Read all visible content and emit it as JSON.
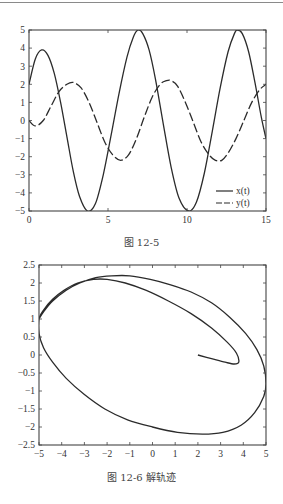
{
  "chart_data": [
    {
      "type": "line",
      "title": "",
      "caption": "图 12-5",
      "xlabel": "",
      "ylabel": "",
      "xlim": [
        0,
        15
      ],
      "ylim": [
        -5,
        5
      ],
      "xticks": [
        0,
        5,
        10,
        15
      ],
      "yticks": [
        5,
        4,
        3,
        2,
        1,
        0,
        -1,
        -2,
        -3,
        -4,
        -5
      ],
      "grid": false,
      "legend_position": "lower right",
      "series": [
        {
          "name": "x(t)",
          "style": "solid",
          "x": [
            0,
            0.4,
            0.8,
            1.2,
            1.6,
            2.0,
            2.4,
            2.8,
            3.2,
            3.7,
            4.2,
            4.7,
            5.2,
            5.7,
            6.2,
            6.6,
            6.9,
            7.2,
            7.6,
            8.0,
            8.5,
            9.0,
            9.5,
            10.1,
            10.6,
            11.1,
            11.6,
            12.1,
            12.6,
            13.0,
            13.2,
            13.5,
            13.9,
            14.3,
            14.7,
            15.0
          ],
          "y": [
            2.0,
            3.4,
            3.9,
            3.6,
            2.6,
            1.0,
            -0.9,
            -2.8,
            -4.2,
            -5.0,
            -4.6,
            -3.0,
            -0.8,
            1.5,
            3.5,
            4.6,
            5.0,
            4.8,
            3.9,
            2.3,
            -0.2,
            -2.6,
            -4.3,
            -5.0,
            -4.5,
            -2.9,
            -0.6,
            1.8,
            3.8,
            4.8,
            5.0,
            4.8,
            3.8,
            2.1,
            0.2,
            -1.0
          ]
        },
        {
          "name": "y(t)",
          "style": "dashed",
          "x": [
            0,
            0.4,
            0.9,
            1.4,
            1.9,
            2.4,
            2.8,
            3.3,
            3.8,
            4.3,
            4.8,
            5.3,
            5.8,
            6.3,
            6.8,
            7.3,
            7.8,
            8.3,
            8.7,
            9.0,
            9.4,
            9.9,
            10.4,
            10.9,
            11.4,
            11.8,
            12.2,
            12.6,
            13.1,
            13.6,
            14.1,
            14.6,
            15.0
          ],
          "y": [
            0.0,
            -0.3,
            0.0,
            0.8,
            1.6,
            2.0,
            2.1,
            1.8,
            1.0,
            -0.1,
            -1.2,
            -1.9,
            -2.2,
            -1.9,
            -1.0,
            0.2,
            1.3,
            2.0,
            2.2,
            2.2,
            1.9,
            1.0,
            -0.1,
            -1.2,
            -1.9,
            -2.2,
            -2.2,
            -1.8,
            -1.0,
            0.0,
            1.0,
            1.7,
            2.0
          ]
        }
      ]
    },
    {
      "type": "line",
      "title": "",
      "caption": "图 12-6   解轨迹",
      "xlabel": "",
      "ylabel": "",
      "xlim": [
        -5,
        5
      ],
      "ylim": [
        -2.5,
        2.5
      ],
      "xticks": [
        -5,
        -4,
        -3,
        -2,
        -1,
        0,
        1,
        2,
        3,
        4,
        5
      ],
      "yticks": [
        2.5,
        2,
        1.5,
        1,
        0.5,
        0,
        -0.5,
        -1,
        -1.5,
        -2,
        -2.5
      ],
      "grid": false,
      "series": [
        {
          "name": "trajectory",
          "style": "solid",
          "x": [
            2.0,
            2.6,
            3.2,
            3.6,
            3.8,
            3.7,
            3.3,
            2.6,
            1.7,
            0.7,
            -0.3,
            -1.2,
            -2.0,
            -2.6,
            -3.3,
            -3.9,
            -4.4,
            -4.8,
            -5.0,
            -5.0,
            -4.8,
            -4.4,
            -3.8,
            -3.0,
            -2.1,
            -1.1,
            0.0,
            1.1,
            2.2,
            3.1,
            3.9,
            4.5,
            4.9,
            5.0,
            4.9,
            4.6,
            4.1,
            3.4,
            2.6,
            1.7,
            0.8,
            -0.1,
            -1.0,
            -1.8,
            -2.5,
            -3.2,
            -3.8,
            -4.4,
            -4.8,
            -5.0
          ],
          "y": [
            0.0,
            -0.1,
            -0.2,
            -0.25,
            -0.2,
            0.05,
            0.35,
            0.75,
            1.15,
            1.5,
            1.8,
            2.0,
            2.1,
            2.1,
            2.0,
            1.8,
            1.55,
            1.25,
            1.0,
            0.6,
            0.2,
            -0.2,
            -0.65,
            -1.1,
            -1.5,
            -1.8,
            -2.0,
            -2.15,
            -2.2,
            -2.15,
            -1.95,
            -1.6,
            -1.15,
            -0.8,
            -0.3,
            0.15,
            0.6,
            1.05,
            1.45,
            1.75,
            1.95,
            2.1,
            2.2,
            2.2,
            2.15,
            2.0,
            1.8,
            1.5,
            1.2,
            1.0
          ]
        }
      ]
    }
  ],
  "figures": {
    "fig1": {
      "caption": "图 12-5",
      "legend": [
        "x(t)",
        "y(t)"
      ]
    },
    "fig2": {
      "caption": "图 12-6   解轨迹"
    }
  }
}
